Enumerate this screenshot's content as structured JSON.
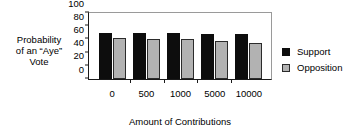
{
  "chart_data": {
    "type": "bar",
    "title": "",
    "xlabel": "Amount of Contributions",
    "ylabel": "Probability of an \"Aye\" Vote",
    "ylabel_lines": [
      "Probability",
      "of an “Aye”",
      "Vote"
    ],
    "categories": [
      "0",
      "500",
      "1000",
      "5000",
      "10000"
    ],
    "series": [
      {
        "name": "Support",
        "color": "#0d0d0d",
        "values": [
          70,
          70,
          69,
          68,
          68
        ]
      },
      {
        "name": "Opposition",
        "color": "#b2b2b2",
        "values": [
          62,
          61,
          60,
          57,
          54
        ]
      }
    ],
    "ylim": [
      0,
      100
    ],
    "yticks": [
      0,
      20,
      40,
      60,
      80,
      100
    ],
    "ytick_labels": [
      "0",
      "20",
      "40",
      "60",
      "80",
      "100"
    ],
    "grid": false,
    "legend_position": "right",
    "legend": [
      {
        "label": "Support",
        "swatch": "solid-black-square"
      },
      {
        "label": "Opposition",
        "swatch": "gray-outlined-square"
      }
    ]
  }
}
